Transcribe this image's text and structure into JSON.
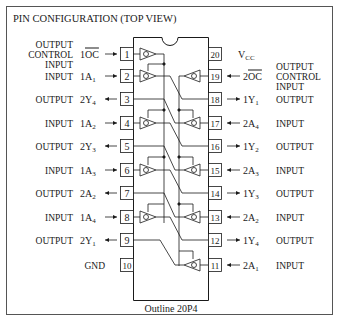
{
  "title": "PIN CONFIGURATION (TOP VIEW)",
  "outline": "Outline 20P4",
  "left_pins": [
    {
      "num": "1",
      "signal": "1OC",
      "overline": true,
      "dir": "in",
      "role": [
        "OUTPUT",
        "CONTROL",
        "INPUT"
      ]
    },
    {
      "num": "2",
      "signal": "1A",
      "sub": "1",
      "dir": "in",
      "role": [
        "INPUT"
      ]
    },
    {
      "num": "3",
      "signal": "2Y",
      "sub": "4",
      "dir": "out",
      "role": [
        "OUTPUT"
      ]
    },
    {
      "num": "4",
      "signal": "1A",
      "sub": "2",
      "dir": "in",
      "role": [
        "INPUT"
      ]
    },
    {
      "num": "5",
      "signal": "2Y",
      "sub": "3",
      "dir": "out",
      "role": [
        "OUTPUT"
      ]
    },
    {
      "num": "6",
      "signal": "1A",
      "sub": "3",
      "dir": "in",
      "role": [
        "INPUT"
      ]
    },
    {
      "num": "7",
      "signal": "2A",
      "sub": "2",
      "dir": "out",
      "role": [
        "OUTPUT"
      ]
    },
    {
      "num": "8",
      "signal": "1A",
      "sub": "4",
      "dir": "in",
      "role": [
        "INPUT"
      ]
    },
    {
      "num": "9",
      "signal": "2Y",
      "sub": "1",
      "dir": "out",
      "role": [
        "OUTPUT"
      ]
    },
    {
      "num": "10",
      "signal": "",
      "dir": "none",
      "role": [
        "GND"
      ]
    }
  ],
  "right_pins": [
    {
      "num": "20",
      "signal": "V",
      "sub": "CC",
      "dir": "none",
      "role": []
    },
    {
      "num": "19",
      "signal": "2OC",
      "overline": true,
      "dir": "in",
      "role": [
        "OUTPUT",
        "CONTROL",
        "INPUT"
      ]
    },
    {
      "num": "18",
      "signal": "1Y",
      "sub": "1",
      "dir": "out",
      "role": [
        "OUTPUT"
      ]
    },
    {
      "num": "17",
      "signal": "2A",
      "sub": "4",
      "dir": "in",
      "role": [
        "INPUT"
      ]
    },
    {
      "num": "16",
      "signal": "1Y",
      "sub": "2",
      "dir": "out",
      "role": [
        "OUTPUT"
      ]
    },
    {
      "num": "15",
      "signal": "2A",
      "sub": "3",
      "dir": "in",
      "role": [
        "INPUT"
      ]
    },
    {
      "num": "14",
      "signal": "1Y",
      "sub": "3",
      "dir": "out",
      "role": [
        "OUTPUT"
      ]
    },
    {
      "num": "13",
      "signal": "2A",
      "sub": "2",
      "dir": "in",
      "role": [
        "INPUT"
      ]
    },
    {
      "num": "12",
      "signal": "1Y",
      "sub": "4",
      "dir": "out",
      "role": [
        "OUTPUT"
      ]
    },
    {
      "num": "11",
      "signal": "2A",
      "sub": "1",
      "dir": "in",
      "role": [
        "INPUT"
      ]
    }
  ],
  "colors": {
    "line": "#1a1a1a",
    "frame": "#555555",
    "background": "#ffffff"
  }
}
